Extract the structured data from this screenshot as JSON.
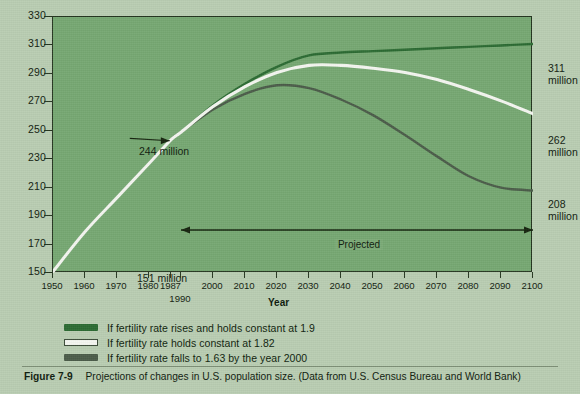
{
  "figure": {
    "number": "Figure 7-9",
    "caption": "Projections of changes in U.S. population size. (Data from U.S. Census Bureau and World Bank)"
  },
  "colors": {
    "page_background": "#b9cdb2",
    "plot_background": "#76a872",
    "axis": "#24351f",
    "series_high": "#2c6b33",
    "series_mid": "#f4f6f0",
    "series_low": "#4b5c49"
  },
  "annotations": {
    "projected": "Projected",
    "start_value": "151 million",
    "convergence_value": "244 million",
    "end_high": "311\nmillion",
    "end_mid": "262\nmillion",
    "end_low": "208\nmillion"
  },
  "legend": {
    "items": [
      {
        "label": "If fertility rate rises and holds constant at 1.9",
        "swatch": "sw-green"
      },
      {
        "label": "If fertility rate holds constant at 1.82",
        "swatch": "sw-white"
      },
      {
        "label": "If fertility rate falls to 1.63 by the year 2000",
        "swatch": "sw-gray"
      }
    ]
  },
  "chart_data": {
    "type": "line",
    "title": "Projections of changes in U.S. population size",
    "xlabel": "Year",
    "ylabel": "Population (millions)",
    "xlim": [
      1950,
      2100
    ],
    "ylim": [
      150,
      330
    ],
    "xticks": [
      1950,
      1960,
      1970,
      1980,
      1987,
      2000,
      2010,
      2020,
      2030,
      2040,
      2050,
      2060,
      2070,
      2080,
      2090,
      2100
    ],
    "xtick_labels": [
      "1950",
      "1960",
      "1970",
      "1980",
      "1987",
      "2000",
      "2010",
      "2020",
      "2030",
      "2040",
      "2050",
      "2060",
      "2070",
      "2080",
      "2090",
      "2100"
    ],
    "x_sub_tick": 1990,
    "x_sub_tick_label": "1990",
    "yticks": [
      150,
      170,
      190,
      210,
      230,
      250,
      270,
      290,
      310,
      330
    ],
    "ytick_labels": [
      "150",
      "170",
      "190",
      "210",
      "230",
      "250",
      "270",
      "290",
      "310",
      "330"
    ],
    "grid": false,
    "legend_position": "below",
    "projected_span": [
      1990,
      2100
    ],
    "series": [
      {
        "name": "If fertility rate rises and holds constant at 1.9",
        "color": "#2c6b33",
        "x": [
          1950,
          1960,
          1970,
          1980,
          1987,
          1990,
          2000,
          2010,
          2020,
          2030,
          2040,
          2050,
          2060,
          2070,
          2080,
          2090,
          2100
        ],
        "values": [
          151,
          179,
          203,
          227,
          244,
          249,
          268,
          283,
          295,
          303,
          305,
          306,
          307,
          308,
          309,
          310,
          311
        ]
      },
      {
        "name": "If fertility rate holds constant at 1.82",
        "color": "#f4f6f0",
        "x": [
          1950,
          1960,
          1970,
          1980,
          1987,
          1990,
          2000,
          2010,
          2020,
          2030,
          2040,
          2050,
          2060,
          2070,
          2080,
          2090,
          2100
        ],
        "values": [
          151,
          179,
          203,
          227,
          244,
          249,
          267,
          281,
          291,
          296,
          296,
          294,
          291,
          286,
          279,
          271,
          262
        ]
      },
      {
        "name": "If fertility rate falls to 1.63 by the year 2000",
        "color": "#4b5c49",
        "x": [
          1950,
          1960,
          1970,
          1980,
          1987,
          1990,
          2000,
          2010,
          2020,
          2030,
          2040,
          2050,
          2060,
          2070,
          2080,
          2090,
          2100
        ],
        "values": [
          151,
          179,
          203,
          227,
          244,
          249,
          265,
          276,
          282,
          280,
          272,
          261,
          247,
          232,
          218,
          210,
          208
        ]
      }
    ],
    "data_labels": [
      {
        "text": "151 million",
        "x": 1950,
        "y": 151
      },
      {
        "text": "244 million",
        "x": 1987,
        "y": 244
      },
      {
        "text": "311 million",
        "x": 2100,
        "y": 311
      },
      {
        "text": "262 million",
        "x": 2100,
        "y": 262
      },
      {
        "text": "208 million",
        "x": 2100,
        "y": 208
      }
    ]
  }
}
